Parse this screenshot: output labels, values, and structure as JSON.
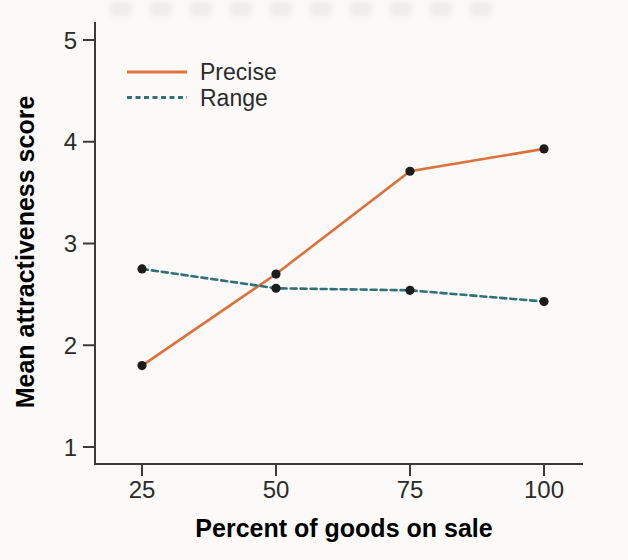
{
  "page": {
    "background_color": "#fbfaf8"
  },
  "chart_data": {
    "type": "line",
    "title": "",
    "xlabel": "Percent of goods on sale",
    "ylabel": "Mean attractiveness score",
    "x": [
      25,
      50,
      75,
      100
    ],
    "xticks": [
      "25",
      "50",
      "75",
      "100"
    ],
    "yticks": [
      "1",
      "2",
      "3",
      "4",
      "5"
    ],
    "ylim": [
      1,
      5
    ],
    "xlim": [
      25,
      100
    ],
    "grid": false,
    "legend_position": "top-left",
    "series": [
      {
        "name": "Precise",
        "style": "solid",
        "color": "#e0703a",
        "values": [
          1.8,
          2.7,
          3.71,
          3.93
        ]
      },
      {
        "name": "Range",
        "style": "dashed",
        "color": "#2f707b",
        "values": [
          2.75,
          2.56,
          2.54,
          2.43
        ]
      }
    ],
    "marker": {
      "shape": "circle",
      "color": "#1c1c1c"
    },
    "axis_color": "#3b3b3b",
    "text_color": "#2b2b2b"
  }
}
